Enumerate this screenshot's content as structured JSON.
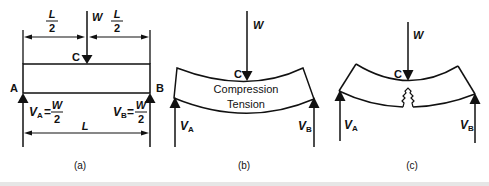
{
  "figure": {
    "panels": [
      {
        "caption": "(a)",
        "load": "W",
        "point_c": "C",
        "half_span_num": "L",
        "half_span_den": "2",
        "span": "L",
        "support_a": "A",
        "support_b": "B",
        "reaction_a": {
          "symbol": "V",
          "sub": "A",
          "eq": "=",
          "num": "W",
          "den": "2"
        },
        "reaction_b": {
          "symbol": "V",
          "sub": "B",
          "eq": "=",
          "num": "W",
          "den": "2"
        }
      },
      {
        "caption": "(b)",
        "load": "W",
        "point_c": "C",
        "zone_top": "Compression",
        "zone_bottom": "Tension",
        "reaction_a": {
          "symbol": "V",
          "sub": "A"
        },
        "reaction_b": {
          "symbol": "V",
          "sub": "B"
        }
      },
      {
        "caption": "(c)",
        "load": "W",
        "point_c": "C",
        "reaction_a": {
          "symbol": "V",
          "sub": "A"
        },
        "reaction_b": {
          "symbol": "V",
          "sub": "B"
        }
      }
    ],
    "colors": {
      "ink": "#111111",
      "background": "#ffffff"
    }
  }
}
